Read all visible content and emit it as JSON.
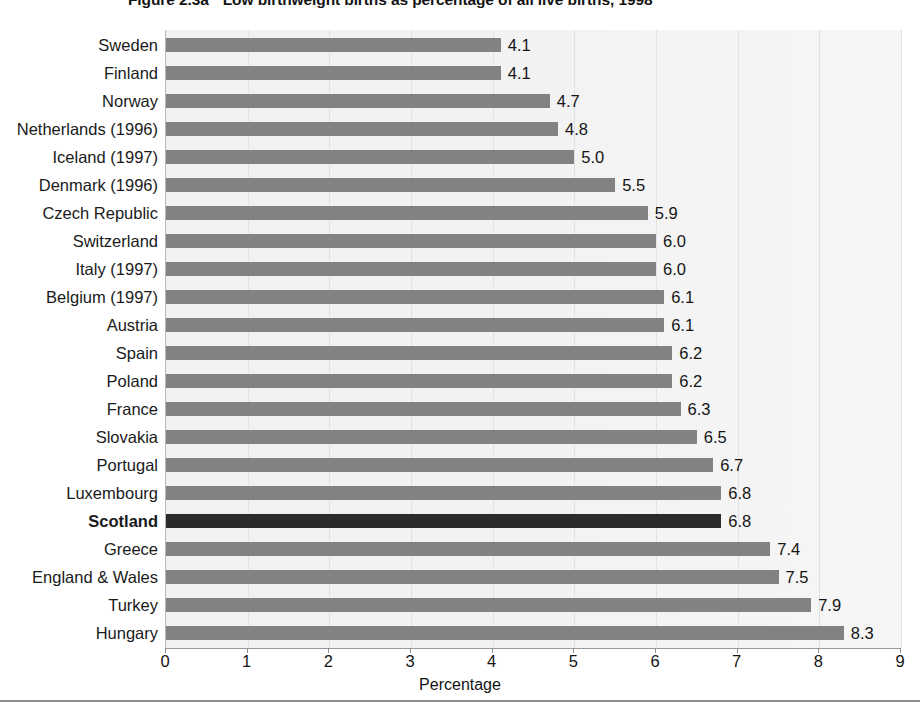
{
  "figure": {
    "number": "Figure 2.3a",
    "caption": "Low birthweight births as percentage of all live births, 1998"
  },
  "axis": {
    "xlabel": "Percentage",
    "xticks": [
      "0",
      "1",
      "2",
      "3",
      "4",
      "5",
      "6",
      "7",
      "8",
      "9"
    ]
  },
  "colors": {
    "bar": "#828282",
    "bar_highlight": "#2b2b2b",
    "plot_background": "#f2f2f2",
    "gridline": "#e2e2e2",
    "axis": "#9a9a9a",
    "text": "#141414"
  },
  "chart_data": {
    "type": "bar",
    "orientation": "horizontal",
    "xlabel": "Percentage",
    "ylabel": "",
    "xlim": [
      0,
      9
    ],
    "grid": true,
    "legend": "none",
    "highlight_category": "Scotland",
    "categories": [
      "Sweden",
      "Finland",
      "Norway",
      "Netherlands (1996)",
      "Iceland (1997)",
      "Denmark (1996)",
      "Czech Republic",
      "Switzerland",
      "Italy (1997)",
      "Belgium (1997)",
      "Austria",
      "Spain",
      "Poland",
      "France",
      "Slovakia",
      "Portugal",
      "Luxembourg",
      "Scotland",
      "Greece",
      "England & Wales",
      "Turkey",
      "Hungary"
    ],
    "values": [
      4.1,
      4.1,
      4.7,
      4.8,
      5.0,
      5.5,
      5.9,
      6.0,
      6.0,
      6.1,
      6.1,
      6.2,
      6.2,
      6.3,
      6.5,
      6.7,
      6.8,
      6.8,
      7.4,
      7.5,
      7.9,
      8.3
    ],
    "value_labels": [
      "4.1",
      "4.1",
      "4.7",
      "4.8",
      "5.0",
      "5.5",
      "5.9",
      "6.0",
      "6.0",
      "6.1",
      "6.1",
      "6.2",
      "6.2",
      "6.3",
      "6.5",
      "6.7",
      "6.8",
      "6.8",
      "7.4",
      "7.5",
      "7.9",
      "8.3"
    ]
  }
}
